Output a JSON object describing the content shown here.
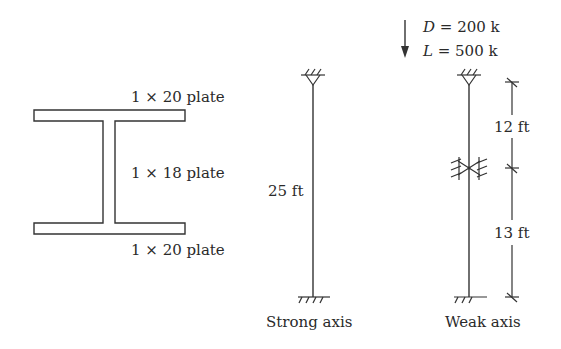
{
  "section": {
    "top_flange": "1 × 20 plate",
    "web": "1 × 18 plate",
    "bottom_flange": "1 × 20 plate"
  },
  "loads": {
    "dead_symbol": "D",
    "dead_value": " = 200 k",
    "live_symbol": "L",
    "live_value": " = 500 k"
  },
  "strong_axis": {
    "length": "25 ft",
    "caption": "Strong axis"
  },
  "weak_axis": {
    "upper_length": "12 ft",
    "lower_length": "13 ft",
    "caption": "Weak axis"
  },
  "icons": {
    "load_arrow": "down-arrow-icon",
    "pin_support": "pin-support-icon",
    "fixed_support": "fixed-support-icon",
    "brace": "lateral-brace-icon"
  },
  "colors": {
    "line": "#333333",
    "text": "#2a2a2a",
    "background": "#ffffff"
  }
}
